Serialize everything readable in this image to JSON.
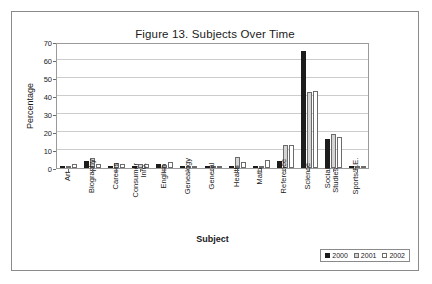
{
  "figure": {
    "title": "Figure 13. Subjects Over Time"
  },
  "chart_data": {
    "type": "bar",
    "title": "Figure 13. Subjects Over Time",
    "xlabel": "Subject",
    "ylabel": "Percentage",
    "ylim": [
      0,
      70
    ],
    "ytick_step": 10,
    "yticks": [
      0,
      10,
      20,
      30,
      40,
      50,
      60,
      70
    ],
    "ytick_labels": [
      "0",
      "10",
      "20",
      "30",
      "40",
      "50",
      "60",
      "70"
    ],
    "grid": true,
    "legend_position": "bottom-right",
    "categories": [
      "Art",
      "Biography",
      "Careers",
      "Consumer Info.",
      "English",
      "Genealogy",
      "General",
      "Health",
      "Math",
      "Reference",
      "Science",
      "Social Studies",
      "Sports/P.E."
    ],
    "series": [
      {
        "name": "2000",
        "color": "#1c1c1c",
        "values": [
          1,
          4,
          1,
          0,
          2.5,
          0,
          0,
          1,
          0,
          4,
          65,
          16,
          0
        ]
      },
      {
        "name": "2001",
        "color": "#d4d4d4",
        "values": [
          1,
          5.5,
          3,
          2,
          1.5,
          0.2,
          0.3,
          6,
          0.5,
          13,
          42,
          19,
          0.5
        ]
      },
      {
        "name": "2002",
        "color": "#ffffff",
        "values": [
          2,
          2,
          2,
          2,
          3.5,
          1,
          1,
          3.5,
          4.5,
          13,
          43,
          17,
          0.5
        ]
      }
    ],
    "legend": [
      {
        "label": "2000",
        "swatch": "black-filled-square"
      },
      {
        "label": "2001",
        "swatch": "gray-filled-square"
      },
      {
        "label": "2002",
        "swatch": "white-filled-square"
      }
    ]
  }
}
